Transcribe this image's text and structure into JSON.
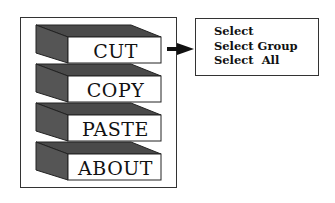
{
  "menu": {
    "buttons": [
      {
        "label": "CUT"
      },
      {
        "label": "COPY"
      },
      {
        "label": "PASTE"
      },
      {
        "label": "ABOUT"
      }
    ]
  },
  "submenu": {
    "items": [
      {
        "label": "Select"
      },
      {
        "label": "Select Group"
      },
      {
        "label": "Select  All"
      }
    ]
  },
  "colors": {
    "side_face": "#555555",
    "top_face": "#4a4a4a",
    "front_face": "#ffffff",
    "outline": "#222222"
  }
}
